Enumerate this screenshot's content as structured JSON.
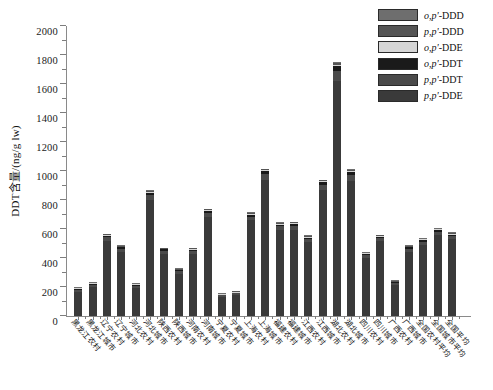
{
  "chart_data": {
    "type": "bar",
    "stacked": true,
    "title": "",
    "xlabel": "",
    "ylabel": "DDT含量/(ng/g lw)",
    "ylim": [
      0,
      2000
    ],
    "ytick_step": 200,
    "yminor_step": 100,
    "ytick_labels": [
      "0",
      "200",
      "400",
      "600",
      "800",
      "1000",
      "1200",
      "1400",
      "1600",
      "1800",
      "2000"
    ],
    "grid": false,
    "legend_position": "top-right",
    "categories": [
      "黑龙江农村",
      "黑龙江城市",
      "辽宁农村",
      "辽宁城市",
      "河北农村",
      "河北城市",
      "陕西农村",
      "陕西城市",
      "河南农村",
      "河南城市",
      "宁夏农村",
      "宁夏城市",
      "上海农村",
      "上海城市",
      "福建农村",
      "福建城市",
      "江西农村",
      "江西城市",
      "湖北农村",
      "湖北城市",
      "四川农村",
      "四川城市",
      "广西农村",
      "广西城市",
      "全国农村平均",
      "全国城市平均",
      "全国平均"
    ],
    "series": [
      {
        "name": "p,p'-DDE",
        "color": "#3a3a3a",
        "values": [
          168,
          200,
          520,
          440,
          196,
          800,
          430,
          292,
          428,
          682,
          132,
          146,
          660,
          940,
          592,
          596,
          508,
          868,
          1624,
          930,
          400,
          514,
          212,
          444,
          490,
          556,
          528
        ]
      },
      {
        "name": "p,p'-DDT",
        "color": "#4a4a4a",
        "values": [
          12,
          16,
          22,
          22,
          14,
          34,
          20,
          16,
          20,
          28,
          10,
          10,
          26,
          38,
          26,
          28,
          22,
          36,
          66,
          40,
          18,
          22,
          14,
          20,
          22,
          24,
          22
        ]
      },
      {
        "name": "o,p'-DDT",
        "color": "#1a1a1a",
        "values": [
          7,
          7,
          12,
          11,
          6,
          15,
          9,
          8,
          10,
          14,
          5,
          6,
          13,
          19,
          12,
          13,
          11,
          17,
          32,
          20,
          10,
          11,
          8,
          10,
          11,
          12,
          11
        ]
      },
      {
        "name": "o,p'-DDE",
        "color": "#d6d6d6",
        "values": [
          3,
          3,
          4,
          4,
          3,
          6,
          4,
          3,
          4,
          6,
          2,
          3,
          6,
          8,
          5,
          5,
          5,
          7,
          12,
          8,
          4,
          5,
          3,
          4,
          5,
          5,
          5
        ]
      },
      {
        "name": "p,p'-DDD",
        "color": "#555555",
        "values": [
          3,
          3,
          5,
          6,
          4,
          7,
          5,
          4,
          6,
          7,
          3,
          3,
          7,
          8,
          7,
          6,
          7,
          9,
          12,
          9,
          6,
          6,
          5,
          5,
          5,
          6,
          7
        ]
      },
      {
        "name": "o,p'-DDD",
        "color": "#6e6e6e",
        "values": [
          2,
          1,
          2,
          2,
          2,
          3,
          2,
          2,
          2,
          3,
          3,
          2,
          3,
          2,
          3,
          2,
          2,
          3,
          4,
          3,
          2,
          2,
          3,
          2,
          2,
          2,
          2
        ]
      }
    ],
    "totals": [
      195,
      230,
      565,
      485,
      225,
      865,
      470,
      325,
      470,
      740,
      155,
      170,
      715,
      1015,
      645,
      650,
      555,
      940,
      1750,
      1010,
      440,
      560,
      245,
      485,
      535,
      605,
      575
    ]
  },
  "legend": {
    "items": [
      {
        "label": "o,p'-DDD",
        "prefix": "o,p'",
        "suffix": "-DDD",
        "color": "#6e6e6e"
      },
      {
        "label": "p,p'-DDD",
        "prefix": "p,p'",
        "suffix": "-DDD",
        "color": "#555555"
      },
      {
        "label": "o,p'-DDE",
        "prefix": "o,p'",
        "suffix": "-DDE",
        "color": "#d6d6d6"
      },
      {
        "label": "o,p'-DDT",
        "prefix": "o,p'",
        "suffix": "-DDT",
        "color": "#1a1a1a"
      },
      {
        "label": "p,p'-DDT",
        "prefix": "p,p'",
        "suffix": "-DDT",
        "color": "#4a4a4a"
      },
      {
        "label": "p,p'-DDE",
        "prefix": "p,p'",
        "suffix": "-DDE",
        "color": "#3a3a3a"
      }
    ]
  },
  "axis": {
    "y_title": "DDT含量/(ng/g lw)"
  }
}
